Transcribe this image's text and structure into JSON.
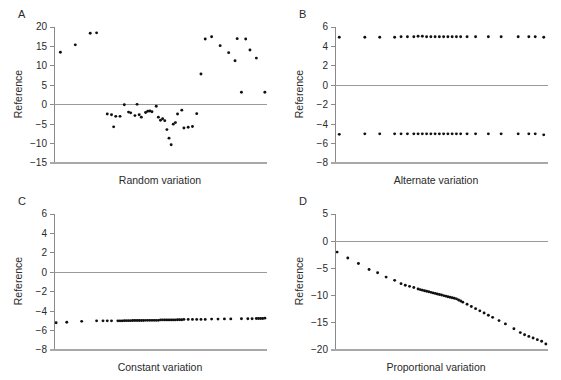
{
  "figure": {
    "background": "#ffffff",
    "dot_color": "#101010",
    "axis_color": "#8a8a8a",
    "zero_line_color": "#9a9a9a",
    "text_color": "#2a2a2a"
  },
  "panels": [
    {
      "letter": "A",
      "ylabel": "Reference",
      "xlabel": "Random variation"
    },
    {
      "letter": "B",
      "ylabel": "Reference",
      "xlabel": "Alternate variation"
    },
    {
      "letter": "C",
      "ylabel": "Reference",
      "xlabel": "Constant variation"
    },
    {
      "letter": "D",
      "ylabel": "Reference",
      "xlabel": "Proportional variation"
    }
  ],
  "chart_data": [
    {
      "type": "scatter",
      "panel": "A",
      "title": "",
      "xlabel": "Random variation",
      "ylabel": "Reference",
      "yticks": [
        20,
        15,
        10,
        5,
        0,
        -5,
        -10,
        -15
      ],
      "ylim": [
        -15,
        20
      ],
      "xlim": [
        0,
        100
      ],
      "grid": false,
      "zero_line": true,
      "tick_labels": [
        "20",
        "15",
        "10",
        "5",
        "0",
        "-5",
        "-10",
        "-15"
      ],
      "x": [
        3,
        10,
        17,
        20,
        25,
        27,
        28,
        29,
        31,
        33,
        35,
        36,
        38,
        39,
        40,
        41,
        43,
        44,
        45,
        46,
        48,
        49,
        50,
        51,
        52,
        53,
        54,
        55,
        56,
        57,
        58,
        60,
        61,
        63,
        65,
        67,
        69,
        71,
        74,
        78,
        82,
        85,
        86,
        88,
        90,
        92,
        95,
        99
      ],
      "y": [
        13.5,
        15.4,
        18.4,
        18.5,
        -2.4,
        -2.6,
        -5.7,
        -3.0,
        -3.0,
        0.0,
        -1.9,
        -2.1,
        -2.8,
        0.1,
        -2.6,
        -3.2,
        -2.0,
        -1.7,
        -1.6,
        -1.8,
        -0.4,
        -3.2,
        -4.0,
        -3.6,
        -4.1,
        -6.4,
        -8.6,
        -10.3,
        -5.0,
        -4.6,
        -2.4,
        -1.4,
        -6.0,
        -5.8,
        -5.6,
        -2.3,
        7.9,
        16.9,
        17.5,
        15.2,
        13.4,
        11.3,
        17.0,
        3.2,
        16.9,
        14.1,
        12.0,
        3.2
      ]
    },
    {
      "type": "scatter",
      "panel": "B",
      "title": "",
      "xlabel": "Alternate variation",
      "ylabel": "Reference",
      "yticks": [
        6,
        4,
        2,
        0,
        -2,
        -4,
        -6,
        -8
      ],
      "ylim": [
        -8,
        6
      ],
      "xlim": [
        0,
        100
      ],
      "grid": false,
      "zero_line": true,
      "tick_labels": [
        "6",
        "4",
        "2",
        "0",
        "-2",
        "-4",
        "-6",
        "-8"
      ],
      "series": [
        {
          "name": "upper band",
          "x": [
            2,
            14,
            21,
            28,
            31,
            34,
            37,
            39,
            41,
            43,
            45,
            47,
            49,
            51,
            53,
            55,
            57,
            59,
            62,
            66,
            72,
            78,
            86,
            91,
            94,
            98
          ],
          "values": [
            4.95,
            4.95,
            4.95,
            4.95,
            5.0,
            5.0,
            5.0,
            5.05,
            5.05,
            5.0,
            5.0,
            5.0,
            5.0,
            5.0,
            5.0,
            5.0,
            5.0,
            5.0,
            5.0,
            5.0,
            5.0,
            5.0,
            5.0,
            5.0,
            5.0,
            4.95
          ]
        },
        {
          "name": "lower band",
          "x": [
            2,
            14,
            21,
            28,
            31,
            34,
            37,
            39,
            41,
            43,
            45,
            47,
            49,
            51,
            53,
            55,
            57,
            59,
            62,
            66,
            72,
            78,
            86,
            91,
            94,
            98
          ],
          "values": [
            -5.05,
            -5.0,
            -5.0,
            -5.0,
            -5.0,
            -5.0,
            -5.0,
            -5.0,
            -5.0,
            -5.0,
            -5.0,
            -5.0,
            -5.0,
            -5.0,
            -5.0,
            -5.0,
            -5.0,
            -5.0,
            -5.0,
            -5.0,
            -5.0,
            -5.0,
            -5.0,
            -5.0,
            -5.0,
            -5.1
          ]
        }
      ]
    },
    {
      "type": "scatter",
      "panel": "C",
      "title": "",
      "xlabel": "Constant variation",
      "ylabel": "Reference",
      "yticks": [
        6,
        4,
        2,
        0,
        -2,
        -4,
        -6,
        -8
      ],
      "ylim": [
        -8,
        6
      ],
      "xlim": [
        0,
        100
      ],
      "grid": false,
      "zero_line": true,
      "tick_labels": [
        "6",
        "4",
        "2",
        "0",
        "-2",
        "-4",
        "-6",
        "-8"
      ],
      "x": [
        1,
        6,
        13,
        20,
        23,
        25,
        27,
        30,
        31,
        32,
        33,
        34,
        35,
        36,
        37,
        38,
        39,
        40,
        41,
        42,
        43,
        44,
        45,
        46,
        47,
        48,
        49,
        50,
        51,
        52,
        53,
        54,
        55,
        56,
        57,
        58,
        59,
        60,
        61,
        63,
        65,
        67,
        69,
        71,
        74,
        77,
        80,
        83,
        88,
        91,
        93,
        95,
        96,
        97,
        98,
        99
      ],
      "y": [
        -5.2,
        -5.15,
        -5.05,
        -5.0,
        -5.0,
        -5.0,
        -5.0,
        -5.0,
        -5.0,
        -5.0,
        -4.98,
        -4.98,
        -4.98,
        -4.98,
        -4.97,
        -4.97,
        -4.97,
        -4.96,
        -4.96,
        -4.96,
        -4.95,
        -4.95,
        -4.95,
        -4.95,
        -4.95,
        -4.95,
        -4.95,
        -4.9,
        -4.9,
        -4.9,
        -4.9,
        -4.9,
        -4.9,
        -4.9,
        -4.9,
        -4.88,
        -4.88,
        -4.88,
        -4.85,
        -4.85,
        -4.85,
        -4.85,
        -4.85,
        -4.85,
        -4.82,
        -4.82,
        -4.8,
        -4.8,
        -4.78,
        -4.78,
        -4.78,
        -4.75,
        -4.75,
        -4.75,
        -4.75,
        -4.72
      ]
    },
    {
      "type": "scatter",
      "panel": "D",
      "title": "",
      "xlabel": "Proportional variation",
      "ylabel": "Reference",
      "yticks": [
        5,
        0,
        -5,
        -10,
        -15,
        -20
      ],
      "ylim": [
        -20,
        5
      ],
      "xlim": [
        0,
        100
      ],
      "grid": false,
      "zero_line": true,
      "tick_labels": [
        "5",
        "0",
        "-5",
        "-10",
        "-15",
        "-20"
      ],
      "x": [
        1,
        6,
        11,
        16,
        20,
        24,
        28,
        31,
        33,
        35,
        37,
        39,
        40,
        41,
        42,
        43,
        44,
        45,
        46,
        47,
        48,
        49,
        50,
        51,
        52,
        53,
        54,
        55,
        56,
        57,
        58,
        59,
        60,
        62,
        64,
        66,
        68,
        70,
        72,
        74,
        77,
        80,
        84,
        87,
        89,
        91,
        93,
        95,
        97,
        99
      ],
      "y": [
        -2.0,
        -3.1,
        -4.1,
        -5.2,
        -5.8,
        -6.6,
        -7.2,
        -7.8,
        -8.1,
        -8.3,
        -8.5,
        -8.8,
        -8.9,
        -9.0,
        -9.1,
        -9.2,
        -9.3,
        -9.4,
        -9.5,
        -9.6,
        -9.7,
        -9.8,
        -9.9,
        -10.0,
        -10.1,
        -10.2,
        -10.3,
        -10.4,
        -10.5,
        -10.6,
        -10.8,
        -11.0,
        -11.2,
        -11.6,
        -12.0,
        -12.4,
        -12.8,
        -13.2,
        -13.6,
        -14.0,
        -14.6,
        -15.2,
        -16.1,
        -16.8,
        -17.2,
        -17.5,
        -17.8,
        -18.1,
        -18.4,
        -18.9
      ]
    }
  ]
}
